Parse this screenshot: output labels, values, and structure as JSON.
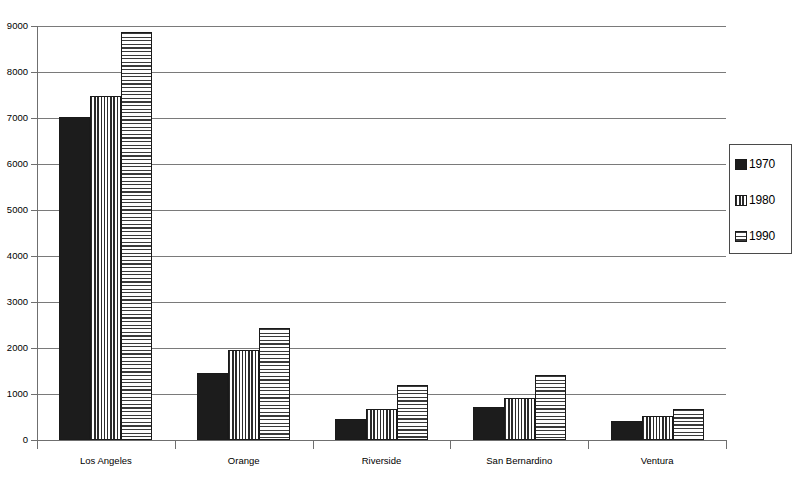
{
  "chart_data": {
    "type": "bar",
    "title": "",
    "subtitle": "",
    "xlabel": "",
    "ylabel": "",
    "categories": [
      "Los Angeles",
      "Orange",
      "Riverside",
      "San Bernardino",
      "Ventura"
    ],
    "series": [
      {
        "name": "1970",
        "pattern": "solid",
        "values": [
          7020,
          1450,
          460,
          710,
          410
        ]
      },
      {
        "name": "1980",
        "pattern": "vstripe",
        "values": [
          7480,
          1950,
          680,
          910,
          530
        ]
      },
      {
        "name": "1990",
        "pattern": "hstripe",
        "values": [
          8880,
          2430,
          1190,
          1420,
          680
        ]
      }
    ],
    "ylim": [
      0,
      9000
    ],
    "yticks": [
      0,
      1000,
      2000,
      3000,
      4000,
      5000,
      6000,
      7000,
      8000,
      9000
    ],
    "ytick_labels": [
      "0",
      "1000",
      "2000",
      "3000",
      "4000",
      "5000",
      "6000",
      "7000",
      "8000",
      "9000"
    ],
    "grid": {
      "horizontal": true,
      "vertical": false
    },
    "legend": {
      "position": "right",
      "entries": [
        {
          "label": "1970",
          "swatch": "solid-black-swatch"
        },
        {
          "label": "1980",
          "swatch": "vertical-stripe-swatch"
        },
        {
          "label": "1990",
          "swatch": "horizontal-stripe-swatch"
        }
      ]
    },
    "colors": {
      "series_1970": "#1c1c1c",
      "series_1980": "#2b2b2b",
      "series_1990": "#3a3a3a",
      "grid": "#7a7a7a",
      "axis": "#6f6f6f",
      "background": "#ffffff"
    }
  }
}
